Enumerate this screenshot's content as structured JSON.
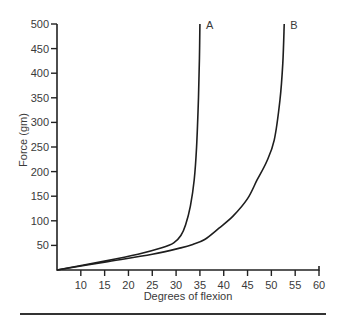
{
  "chart_data": {
    "type": "line",
    "title": "",
    "xlabel": "Degrees of flexion",
    "ylabel": "Force (gm)",
    "xlim": [
      5,
      60
    ],
    "ylim": [
      0,
      500
    ],
    "x_ticks": [
      10,
      15,
      20,
      25,
      30,
      35,
      40,
      45,
      50,
      55,
      60
    ],
    "y_ticks": [
      50,
      100,
      150,
      200,
      250,
      300,
      350,
      400,
      450,
      500
    ],
    "grid": false,
    "legend": "none (curves labeled at top ends)",
    "series": [
      {
        "name": "A",
        "points": [
          [
            5,
            0
          ],
          [
            15,
            18
          ],
          [
            22,
            32
          ],
          [
            27,
            45
          ],
          [
            29.5,
            55
          ],
          [
            31,
            70
          ],
          [
            32,
            92
          ],
          [
            33,
            130
          ],
          [
            33.8,
            183
          ],
          [
            34.3,
            250
          ],
          [
            34.7,
            350
          ],
          [
            34.9,
            430
          ],
          [
            35,
            500
          ]
        ]
      },
      {
        "name": "B",
        "points": [
          [
            5,
            0
          ],
          [
            15,
            16
          ],
          [
            25,
            32
          ],
          [
            31,
            45
          ],
          [
            33.5,
            52
          ],
          [
            36,
            62
          ],
          [
            39,
            85
          ],
          [
            42,
            110
          ],
          [
            45,
            145
          ],
          [
            47,
            183
          ],
          [
            49,
            220
          ],
          [
            50.6,
            264
          ],
          [
            51.8,
            345
          ],
          [
            52.4,
            420
          ],
          [
            52.7,
            500
          ]
        ]
      }
    ]
  }
}
